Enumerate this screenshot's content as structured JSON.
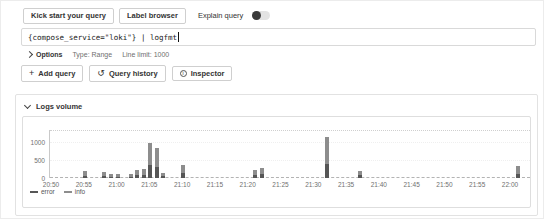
{
  "query_editor": {
    "toolbar": {
      "kick_start_button": "Kick start your query",
      "label_browser_button": "Label browser",
      "explain_query_label": "Explain query",
      "explain_query_toggle_on": false
    },
    "query_input": {
      "value": "{compose_service=\"loki\"} | logfmt"
    },
    "options_row": {
      "options_label": "Options",
      "type_value": "Type: Range",
      "line_limit_value": "Line limit: 1000"
    },
    "actions": {
      "add_query_button": "Add query",
      "query_history_button": "Query history",
      "inspector_button": "Inspector"
    }
  },
  "logs_volume_panel": {
    "title": "Logs volume"
  },
  "colors": {
    "error": "#565656",
    "info": "#8d8d8d",
    "border": "#dedede",
    "axis_text": "#6f6f6f"
  },
  "chart_data": {
    "type": "bar",
    "title": "Logs volume",
    "stacked": true,
    "grid": true,
    "legend_position": "bottom-left",
    "time_axis": {
      "start": "20:50",
      "end": "22:00",
      "tick_interval_minutes": 5
    },
    "x_ticks": [
      "20:50",
      "20:55",
      "21:00",
      "21:05",
      "21:10",
      "21:15",
      "21:20",
      "21:25",
      "21:30",
      "21:35",
      "21:40",
      "21:45",
      "21:50",
      "21:55",
      "22:00"
    ],
    "y_ticks": [
      0,
      500,
      1000
    ],
    "ylim": [
      0,
      1333
    ],
    "series": [
      {
        "name": "error",
        "color": "#565656"
      },
      {
        "name": "info",
        "color": "#8d8d8d"
      }
    ],
    "bars": [
      {
        "time": "20:55",
        "error": 60,
        "info": 130
      },
      {
        "time": "20:58",
        "error": 60,
        "info": 120
      },
      {
        "time": "20:59",
        "error": 40,
        "info": 70
      },
      {
        "time": "21:00",
        "error": 30,
        "info": 70
      },
      {
        "time": "21:02",
        "error": 40,
        "info": 70
      },
      {
        "time": "21:03",
        "error": 80,
        "info": 140
      },
      {
        "time": "21:04",
        "error": 90,
        "info": 160
      },
      {
        "time": "21:05",
        "error": 350,
        "info": 610
      },
      {
        "time": "21:06",
        "error": 300,
        "info": 530
      },
      {
        "time": "21:07",
        "error": 50,
        "info": 90
      },
      {
        "time": "21:10",
        "error": 130,
        "info": 230
      },
      {
        "time": "21:21",
        "error": 80,
        "info": 140
      },
      {
        "time": "21:22",
        "error": 100,
        "info": 180
      },
      {
        "time": "21:32",
        "error": 400,
        "info": 730
      },
      {
        "time": "21:37",
        "error": 70,
        "info": 130
      },
      {
        "time": "22:01",
        "error": 110,
        "info": 210
      }
    ]
  }
}
